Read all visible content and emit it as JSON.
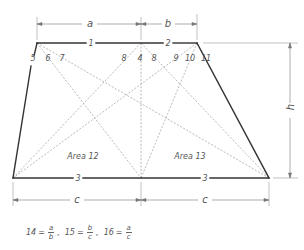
{
  "diagram": {
    "type": "trapezoid-centroid-construction",
    "vertices": {
      "top_left": [
        37,
        43
      ],
      "top_mid": [
        141,
        43
      ],
      "top_right": [
        197,
        43
      ],
      "bottom_left": [
        13,
        178
      ],
      "bottom_mid": [
        141,
        178
      ],
      "bottom_right": [
        269,
        178
      ]
    },
    "edge_labels": {
      "top_left_segment": "1",
      "top_right_segment": "2",
      "bottom_left_segment": "3",
      "bottom_right_segment": "3"
    },
    "point_labels": [
      "5",
      "6",
      "7",
      "8",
      "4",
      "8",
      "9",
      "10",
      "11"
    ],
    "dimensions": {
      "top_left_width": "a",
      "top_right_width": "b",
      "bottom_left_width": "c",
      "bottom_right_width": "c",
      "height": "h"
    },
    "areas": {
      "left": "Area 12",
      "right": "Area 13"
    },
    "colors": {
      "outline": "#333333",
      "dashed": "#888888",
      "dimension": "#777777",
      "text": "#555555"
    }
  },
  "formula": {
    "items": [
      {
        "label": "14",
        "num": "a",
        "den": "b"
      },
      {
        "label": "15",
        "num": "b",
        "den": "c"
      },
      {
        "label": "16",
        "num": "a",
        "den": "c"
      }
    ],
    "separator": ","
  }
}
